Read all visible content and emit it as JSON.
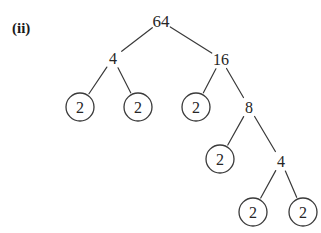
{
  "figure": {
    "part_label": "(ii)",
    "background_color": "#ffffff",
    "stroke_color": "#3a3a3a",
    "text_color": "#262626"
  },
  "chart_data": {
    "type": "diagram",
    "diagram_kind": "factor-tree",
    "title": "(ii)",
    "root_value": 64,
    "nodes": [
      {
        "id": "n64",
        "label": "64",
        "x": 161,
        "y": 21,
        "circled": false,
        "font_size": 17
      },
      {
        "id": "n4a",
        "label": "4",
        "x": 113,
        "y": 58,
        "circled": false,
        "font_size": 16
      },
      {
        "id": "n16",
        "label": "16",
        "x": 221,
        "y": 59,
        "circled": false,
        "font_size": 16
      },
      {
        "id": "n2a",
        "label": "2",
        "x": 80,
        "y": 107,
        "circled": true,
        "font_size": 16
      },
      {
        "id": "n2b",
        "label": "2",
        "x": 138,
        "y": 107,
        "circled": true,
        "font_size": 16
      },
      {
        "id": "n2c",
        "label": "2",
        "x": 196,
        "y": 107,
        "circled": true,
        "font_size": 16
      },
      {
        "id": "n8",
        "label": "8",
        "x": 249,
        "y": 107,
        "circled": false,
        "font_size": 16
      },
      {
        "id": "n2d",
        "label": "2",
        "x": 220,
        "y": 159,
        "circled": true,
        "font_size": 16
      },
      {
        "id": "n4b",
        "label": "4",
        "x": 281,
        "y": 161,
        "circled": false,
        "font_size": 16
      },
      {
        "id": "n2e",
        "label": "2",
        "x": 253,
        "y": 212,
        "circled": true,
        "font_size": 16
      },
      {
        "id": "n2f",
        "label": "2",
        "x": 303,
        "y": 212,
        "circled": true,
        "font_size": 16
      }
    ],
    "edges": [
      {
        "from": "n64",
        "to": "n4a"
      },
      {
        "from": "n64",
        "to": "n16"
      },
      {
        "from": "n4a",
        "to": "n2a"
      },
      {
        "from": "n4a",
        "to": "n2b"
      },
      {
        "from": "n16",
        "to": "n2c"
      },
      {
        "from": "n16",
        "to": "n8"
      },
      {
        "from": "n8",
        "to": "n2d"
      },
      {
        "from": "n8",
        "to": "n4b"
      },
      {
        "from": "n4b",
        "to": "n2e"
      },
      {
        "from": "n4b",
        "to": "n2f"
      }
    ],
    "circle_radius": 14,
    "factorization": "64 = 2 x 2 x 2 x 2 x 2 x 2"
  }
}
